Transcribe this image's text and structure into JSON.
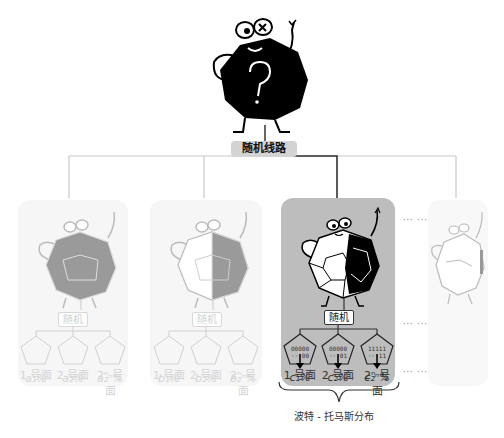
{
  "root": {
    "label": "随机线路",
    "mascot": "black-dodecahedron-question-mark"
  },
  "panels": [
    {
      "id": "panel-a",
      "state": "faded",
      "random_label": "随机",
      "faces": [
        {
          "code_top": "00000",
          "code_bottom": "···00",
          "label": "1 号面",
          "pct": "a₁%"
        },
        {
          "code_top": "00000",
          "code_bottom": "···01",
          "label": "2 号面",
          "pct": "a₂%"
        },
        {
          "code_top": "11111",
          "code_bottom": "···11",
          "label": "2ⁿ 号面",
          "pct": "a₂ⁿ%"
        }
      ],
      "mid_ellipsis": "···"
    },
    {
      "id": "panel-b",
      "state": "faded",
      "random_label": "随机",
      "faces": [
        {
          "code_top": "00000",
          "code_bottom": "···00",
          "label": "1 号面",
          "pct": "b₁%"
        },
        {
          "code_top": "00000",
          "code_bottom": "···01",
          "label": "2 号面",
          "pct": "b₂%"
        },
        {
          "code_top": "11111",
          "code_bottom": "···11",
          "label": "2ⁿ 号面",
          "pct": "b₂ⁿ%"
        }
      ],
      "mid_ellipsis": "···"
    },
    {
      "id": "panel-c",
      "state": "active",
      "random_label": "随机",
      "faces": [
        {
          "code_top": "00000",
          "code_bottom": "···00",
          "label": "1 号面",
          "pct": "c₁%"
        },
        {
          "code_top": "00000",
          "code_bottom": "···01",
          "label": "2 号面",
          "pct": "c₂%"
        },
        {
          "code_top": "11111",
          "code_bottom": "···11",
          "label": "2ⁿ 号面",
          "pct": "c₂ⁿ%"
        }
      ],
      "mid_ellipsis": "···",
      "pct_ellipsis": "···"
    },
    {
      "id": "panel-d",
      "state": "faded-partial"
    }
  ],
  "ellipsis": "··· ···",
  "caption": "波特 - 托马斯分布",
  "colors": {
    "active_panel": "#bdbdbd",
    "faded_panel": "#f6f6f6",
    "active_line": "#333333",
    "faded_line": "#c8c8c8",
    "faded_text": "#d0d0d0"
  }
}
